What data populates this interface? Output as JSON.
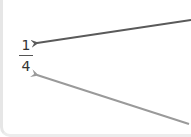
{
  "fraction": {
    "numerator": "1",
    "denominator": "4"
  },
  "arrows": [
    {
      "name": "top-arrow",
      "color": "#5a5a5a",
      "from": [
        191,
        20
      ],
      "to": [
        36,
        43
      ]
    },
    {
      "name": "bottom-arrow",
      "color": "#9a9a9a",
      "from": [
        189,
        124
      ],
      "to": [
        36,
        75
      ]
    }
  ]
}
